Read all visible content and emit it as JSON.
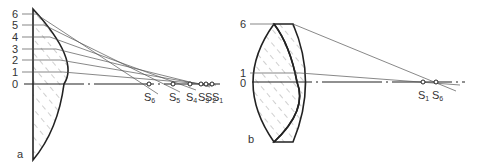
{
  "figure_a": {
    "label": "a",
    "height_labels": [
      "6",
      "5",
      "4",
      "3",
      "2",
      "1",
      "0"
    ],
    "focal_points": [
      {
        "name": "S",
        "sub": "6",
        "x": 149
      },
      {
        "name": "S",
        "sub": "5",
        "x": 173
      },
      {
        "name": "S",
        "sub": "4",
        "x": 190
      },
      {
        "name": "S",
        "sub": "3",
        "x": 201
      },
      {
        "name": "S",
        "sub": "2",
        "x": 206
      },
      {
        "name": "S",
        "sub": "1",
        "x": 212
      }
    ]
  },
  "figure_b": {
    "label": "b",
    "height_labels": [
      "6",
      "1",
      "0"
    ],
    "focal_points": [
      {
        "name": "S",
        "sub": "1",
        "x": 423
      },
      {
        "name": "S",
        "sub": "6",
        "x": 436
      }
    ]
  },
  "colors": {
    "line": "#222222",
    "ray": "#555555",
    "hatch": "#9a9a9a"
  }
}
